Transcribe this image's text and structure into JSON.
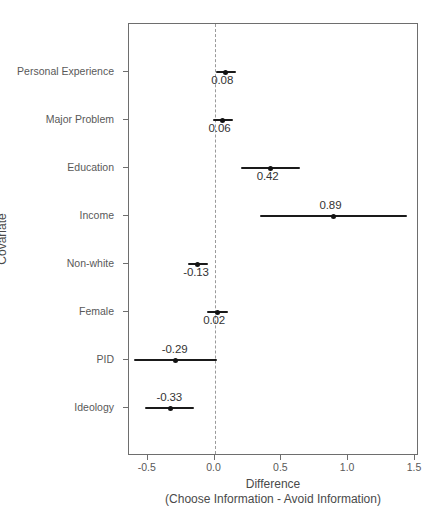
{
  "chart_data": {
    "type": "scatter",
    "title": "",
    "xlabel": "Difference",
    "xlabel_line2": "(Choose Information - Avoid Information)",
    "ylabel": "Covariate",
    "xlim": [
      -0.64,
      1.53
    ],
    "ylim": [
      0,
      9
    ],
    "grid": false,
    "legend": null,
    "reference_line": {
      "x": 0.0,
      "style": "dashed",
      "color": "#9a9a9a"
    },
    "xticks": [
      -0.5,
      0.0,
      0.5,
      1.0,
      1.5
    ],
    "xticklabels": [
      "-0.5",
      "0.0",
      "0.5",
      "1.0",
      "1.5"
    ],
    "categories": [
      "Personal Experience",
      "Major Problem",
      "Education",
      "Income",
      "Non-white",
      "Female",
      "PID",
      "Ideology"
    ],
    "points": [
      {
        "label": "Personal Experience",
        "estimate": 0.08,
        "estimate_label": "0.08",
        "ci_low": 0.01,
        "ci_high": 0.16,
        "label_position": "below"
      },
      {
        "label": "Major Problem",
        "estimate": 0.06,
        "estimate_label": "0.06",
        "ci_low": -0.01,
        "ci_high": 0.14,
        "label_position": "below"
      },
      {
        "label": "Education",
        "estimate": 0.42,
        "estimate_label": "0.42",
        "ci_low": 0.2,
        "ci_high": 0.64,
        "label_position": "below"
      },
      {
        "label": "Income",
        "estimate": 0.89,
        "estimate_label": "0.89",
        "ci_low": 0.34,
        "ci_high": 1.44,
        "label_position": "above"
      },
      {
        "label": "Non-white",
        "estimate": -0.13,
        "estimate_label": "-0.13",
        "ci_low": -0.2,
        "ci_high": -0.05,
        "label_position": "below"
      },
      {
        "label": "Female",
        "estimate": 0.02,
        "estimate_label": "0.02",
        "ci_low": -0.06,
        "ci_high": 0.1,
        "label_position": "below"
      },
      {
        "label": "PID",
        "estimate": -0.29,
        "estimate_label": "-0.29",
        "ci_low": -0.6,
        "ci_high": 0.02,
        "label_position": "above"
      },
      {
        "label": "Ideology",
        "estimate": -0.33,
        "estimate_label": "-0.33",
        "ci_low": -0.52,
        "ci_high": -0.15,
        "label_position": "above"
      }
    ],
    "colors": {
      "point": "#121212",
      "ci": "#1a1a1a",
      "reference_line": "#9a9a9a",
      "panel_border": "#6e6e6e",
      "text": "#4a4a4a",
      "tick_text": "#595959",
      "background": "#ffffff"
    }
  }
}
